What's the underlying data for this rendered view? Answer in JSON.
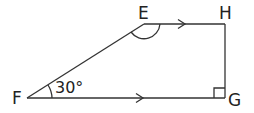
{
  "diagram": {
    "type": "trapezium",
    "vertices": {
      "E": {
        "label": "E",
        "x": 144,
        "y": 24
      },
      "H": {
        "label": "H",
        "x": 225,
        "y": 24
      },
      "G": {
        "label": "G",
        "x": 225,
        "y": 98
      },
      "F": {
        "label": "F",
        "x": 27,
        "y": 98
      }
    },
    "angle_F": "30°",
    "angle_E_marked": true,
    "right_angle_at": "G",
    "parallel_sides": [
      "EH",
      "FG"
    ],
    "stroke_color": "#333333"
  }
}
